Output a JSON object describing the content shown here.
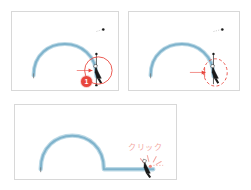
{
  "figure": {
    "background_color": "#ffffff",
    "width": 251,
    "height": 190
  },
  "colors": {
    "curve_stroke": "#7fb3cc",
    "curve_highlight": "#bcd9e6",
    "annotation_red": "#e8453c",
    "annotation_pink": "#f3a9a3",
    "panel_border": "#d8d8d8",
    "anchor_black": "#1a1a1a"
  },
  "panels": [
    {
      "id": "panel-1",
      "name": "step-one-panel",
      "step_number": "❶",
      "badge_label": "❶",
      "highlight_shape": "solid-circle",
      "highlight_style": "solid",
      "path_shape": "arc-open",
      "description": "Arc path with pen cursor over end anchor point, solid red circle highlight",
      "cursor_icon": "pen-tool-cursor",
      "anchor_points": 2,
      "handle_visible": true
    },
    {
      "id": "panel-2",
      "name": "step-two-panel",
      "step_number": "❷",
      "badge_label": "❷",
      "highlight_shape": "dashed-ellipse",
      "highlight_style": "dashed",
      "path_shape": "arc-open",
      "description": "Arc path with pen cursor over end anchor point, dashed red ellipse highlight",
      "cursor_icon": "pen-tool-cursor",
      "anchor_points": 2,
      "handle_visible": true
    },
    {
      "id": "panel-3",
      "name": "step-three-panel",
      "step_number": "❸",
      "badge_label": "❸",
      "highlight_shape": "click-burst",
      "highlight_style": "burst",
      "path_shape": "arc-plus-straight-line",
      "description": "Arc path continued with straight horizontal segment, click burst at new point",
      "cursor_icon": "pen-tool-cursor",
      "annotation_text": "クリック",
      "anchor_points": 3,
      "handle_visible": false
    }
  ],
  "annotations": {
    "click_text": "クリック",
    "click_text_romaji_meaning": "click"
  },
  "badges": [
    {
      "name": "step-badge-1",
      "label": "1"
    },
    {
      "name": "step-badge-2",
      "label": "2"
    },
    {
      "name": "step-badge-3",
      "label": "3"
    }
  ]
}
